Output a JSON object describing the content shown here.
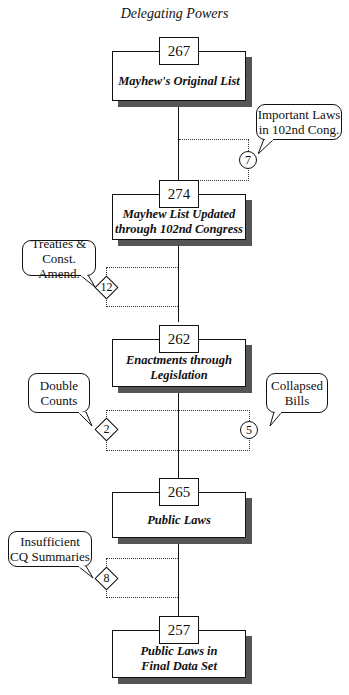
{
  "title": "Delegating Powers",
  "nodes": [
    {
      "count": "267",
      "label": "Mayhew's Original List"
    },
    {
      "count": "274",
      "label": "Mayhew List Updated through 102nd Congress"
    },
    {
      "count": "262",
      "label": "Enactments through Legislation"
    },
    {
      "count": "265",
      "label": "Public Laws"
    },
    {
      "count": "257",
      "label": "Public Laws in Final Data Set"
    }
  ],
  "adjustments": [
    {
      "value": "7",
      "shape": "circle",
      "side": "right",
      "callout": "Important Laws in 102nd Cong.",
      "meaning": "added"
    },
    {
      "value": "12",
      "shape": "diamond",
      "side": "left",
      "callout": "Treaties & Const. Amend.",
      "meaning": "removed"
    },
    {
      "value": "2",
      "shape": "diamond",
      "side": "left",
      "callout": "Double Counts",
      "meaning": "removed"
    },
    {
      "value": "5",
      "shape": "circle",
      "side": "right",
      "callout": "Collapsed Bills",
      "meaning": "added"
    },
    {
      "value": "8",
      "shape": "diamond",
      "side": "left",
      "callout": "Insufficient CQ Summaries",
      "meaning": "removed"
    }
  ],
  "callout_lines": {
    "important_laws": [
      "Important Laws",
      "in 102nd Cong."
    ],
    "treaties": [
      "Treaties &",
      "Const. Amend."
    ],
    "double_counts": [
      "Double",
      "Counts"
    ],
    "collapsed_bills": [
      "Collapsed",
      "Bills"
    ],
    "insufficient": [
      "Insufficient",
      "CQ Summaries"
    ]
  },
  "node_lines": {
    "n2": [
      "Mayhew List Updated",
      "through 102nd Congress"
    ],
    "n3": [
      "Enactments through",
      "Legislation"
    ],
    "n5": [
      "Public Laws in",
      "Final Data Set"
    ]
  }
}
